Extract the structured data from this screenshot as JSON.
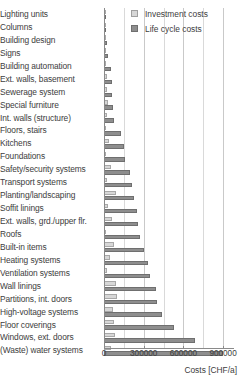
{
  "legend": {
    "position": "top-right",
    "entries": [
      {
        "label": "Investment costs",
        "color": "#d7d7d7",
        "key": "investment"
      },
      {
        "label": "Life cycle costs",
        "color": "#8e8e8e",
        "key": "lifecycle"
      }
    ]
  },
  "axis": {
    "xlabel": "Costs  [CHF/a]",
    "ticks": [
      "0",
      "300000",
      "600000",
      "900000"
    ],
    "tickvalues": [
      0,
      300000,
      600000,
      900000
    ]
  },
  "chart_data": {
    "type": "bar",
    "orientation": "horizontal",
    "title": "",
    "xlabel": "Costs  [CHF/a]",
    "ylabel": "",
    "xlim": [
      0,
      960000
    ],
    "grid": true,
    "legend_position": "top-right",
    "categories": [
      "Lighting units",
      "Columns",
      "Building design",
      "Signs",
      "Building automation",
      "Ext. walls, basement",
      "Sewerage system",
      "Special furniture",
      "Int. walls (structure)",
      "Floors, stairs",
      "Kitchens",
      "Foundations",
      "Safety/security systems",
      "Transport systems",
      "Planting/landscaping",
      "Soffit linings",
      "Ext. walls, grd./upper flr.",
      "Roofs",
      "Built-in items",
      "Heating systems",
      "Ventilation systems",
      "Wall linings",
      "Partitions, int. doors",
      "High-voltage systems",
      "Floor coverings",
      "Windows, ext. doors",
      "(Waste) water systems"
    ],
    "series": [
      {
        "name": "Investment costs",
        "key": "investment",
        "color": "#d7d7d7",
        "values": [
          3000,
          4000,
          6000,
          8000,
          16000,
          21000,
          19000,
          30000,
          26000,
          18000,
          37000,
          9000,
          54000,
          24000,
          93000,
          31000,
          57000,
          18000,
          75000,
          48000,
          24000,
          90000,
          97000,
          69000,
          72000,
          82000,
          55000
        ]
      },
      {
        "name": "Life cycle costs",
        "key": "lifecycle",
        "color": "#8e8e8e",
        "values": [
          12000,
          13000,
          20000,
          33000,
          53000,
          60000,
          63000,
          69000,
          75000,
          130000,
          152000,
          160000,
          200000,
          215000,
          228000,
          248000,
          255000,
          275000,
          305000,
          330000,
          350000,
          390000,
          400000,
          440000,
          530000,
          690000,
          900000
        ]
      }
    ]
  }
}
